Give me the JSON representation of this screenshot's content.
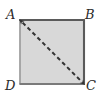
{
  "figure": {
    "type": "geometry-diagram",
    "shape": {
      "name": "square",
      "fill_color": "#d8d8d8",
      "stroke_color": "#5a5a5a",
      "left_stroke_color": "#9a9a9a",
      "stroke_width": 2,
      "x": 19,
      "y": 19,
      "width": 66,
      "height": 66
    },
    "diagonal": {
      "name": "diagonal-AC",
      "style": "dashed",
      "color": "#343434",
      "width": 2,
      "dash_pattern": "4 3",
      "arrowheads": "both",
      "from": "A",
      "to": "C",
      "x1": 20,
      "y1": 20,
      "x2": 84,
      "y2": 84
    },
    "vertices": [
      {
        "id": "A",
        "label": "A",
        "position": "top-left",
        "x": 19,
        "y": 19
      },
      {
        "id": "B",
        "label": "B",
        "position": "top-right",
        "x": 85,
        "y": 19
      },
      {
        "id": "C",
        "label": "C",
        "position": "bottom-right",
        "x": 85,
        "y": 85
      },
      {
        "id": "D",
        "label": "D",
        "position": "bottom-left",
        "x": 19,
        "y": 85
      }
    ]
  }
}
